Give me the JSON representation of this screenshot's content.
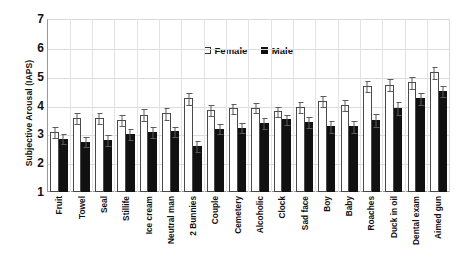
{
  "chart_data": {
    "type": "bar",
    "title": "",
    "xlabel": "",
    "ylabel": "Subjective Arousal (IAPS)",
    "ylim": [
      1,
      7
    ],
    "yticks": [
      7,
      6,
      5,
      4,
      3,
      2,
      1
    ],
    "grid": true,
    "legend_position": "top-center",
    "categories": [
      "Fruit",
      "Towel",
      "Seal",
      "Stillife",
      "Ice cream",
      "Neutral man",
      "2 Bunnies",
      "Couple",
      "Cemetery",
      "Alcoholic",
      "Clock",
      "Sad face",
      "Boy",
      "Baby",
      "Roaches",
      "Duck in oil",
      "Dental exam",
      "Aimed gun"
    ],
    "series": [
      {
        "name": "Female",
        "color": "#ffffff",
        "values": [
          3.08,
          3.57,
          3.57,
          3.5,
          3.68,
          3.73,
          4.25,
          3.85,
          3.9,
          3.93,
          3.8,
          3.95,
          4.15,
          4.02,
          4.68,
          4.72,
          4.8,
          5.15
        ],
        "errors": [
          0.22,
          0.22,
          0.22,
          0.22,
          0.22,
          0.22,
          0.22,
          0.2,
          0.2,
          0.2,
          0.2,
          0.2,
          0.2,
          0.2,
          0.22,
          0.22,
          0.22,
          0.22
        ]
      },
      {
        "name": "Male",
        "color": "#111111",
        "values": [
          2.85,
          2.75,
          2.8,
          3.02,
          3.08,
          3.1,
          2.6,
          3.2,
          3.23,
          3.4,
          3.52,
          3.42,
          3.28,
          3.28,
          3.5,
          3.92,
          4.25,
          4.5
        ],
        "errors": [
          0.2,
          0.2,
          0.2,
          0.2,
          0.2,
          0.2,
          0.2,
          0.2,
          0.2,
          0.2,
          0.2,
          0.2,
          0.22,
          0.22,
          0.25,
          0.25,
          0.22,
          0.22
        ]
      }
    ]
  },
  "legend": {
    "female_label": "Female",
    "male_label": "Male"
  },
  "axis": {
    "y_title": "Subjective Arousal (IAPS)"
  }
}
